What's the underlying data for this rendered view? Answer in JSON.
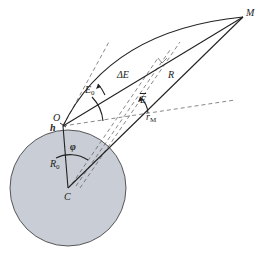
{
  "diagram": {
    "type": "orbital-geometry",
    "colors": {
      "background": "#ffffff",
      "earth_fill": "#c9ced6",
      "stroke": "#222222",
      "dashed": "#444444"
    },
    "labels": {
      "M": "M",
      "O": "O",
      "h": "h",
      "C": "C",
      "R0_main": "R",
      "R0_sub": "0",
      "phi": "φ",
      "E0_main": "E",
      "E0_sub": "0",
      "deltaE": "ΔE",
      "Ebar": "E",
      "R": "R",
      "rM_main": "r",
      "rM_sub": "M"
    }
  }
}
